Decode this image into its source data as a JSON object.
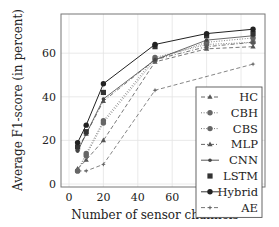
{
  "chart_data": {
    "type": "line",
    "title": "",
    "xlabel": "Number of sensor channels",
    "ylabel": "Average F1-score (in percent)",
    "xlim": [
      -5,
      113
    ],
    "ylim": [
      -1,
      79
    ],
    "xticks": [
      0,
      20,
      40,
      60,
      80,
      100
    ],
    "yticks": [
      0,
      20,
      40,
      60
    ],
    "grid": true,
    "legend_position": "lower right",
    "x": [
      5,
      10,
      20,
      50,
      80,
      107
    ],
    "series": [
      {
        "name": "HC",
        "marker": "triangle",
        "line": "dashed",
        "values": [
          7,
          11,
          20,
          56,
          62,
          63
        ]
      },
      {
        "name": "CBH",
        "marker": "circle",
        "line": "dotted",
        "values": [
          6,
          14,
          29,
          58,
          64,
          65
        ]
      },
      {
        "name": "CBS",
        "marker": "circle",
        "line": "dotted",
        "values": [
          6,
          13,
          28,
          57,
          65,
          67
        ]
      },
      {
        "name": "MLP",
        "marker": "triangle",
        "line": "dashdot",
        "values": [
          16,
          23,
          38,
          57,
          63,
          65
        ]
      },
      {
        "name": "CNN",
        "marker": "dot",
        "line": "solid-thin",
        "values": [
          15,
          23,
          39,
          57,
          66,
          68
        ]
      },
      {
        "name": "LSTM",
        "marker": "square",
        "line": "none",
        "values": [
          17,
          24,
          42,
          63,
          68,
          69
        ]
      },
      {
        "name": "Hybrid",
        "marker": "circle",
        "line": "solid",
        "values": [
          19,
          27,
          46,
          64,
          69,
          71
        ]
      },
      {
        "name": "AE",
        "marker": "star",
        "line": "dashed",
        "values": [
          6,
          6,
          9,
          43,
          null,
          55
        ]
      }
    ]
  },
  "axes": {
    "xlabel": "Number of sensor channels",
    "ylabel": "Average F1-score (in percent)",
    "xtick_labels": [
      "0",
      "20",
      "40",
      "60",
      "80",
      "100"
    ],
    "ytick_labels": [
      "0",
      "20",
      "40",
      "60"
    ]
  },
  "legend": {
    "items": [
      "HC",
      "CBH",
      "CBS",
      "MLP",
      "CNN",
      "LSTM",
      "Hybrid",
      "AE"
    ]
  }
}
